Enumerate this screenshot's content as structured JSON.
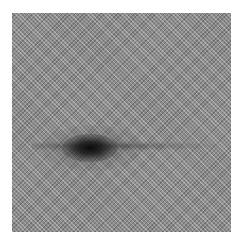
{
  "image": {
    "description": "Grayscale noisy image with fine diagonal checker/stripe texture and a dark elliptical blob left of center, with a faint horizontal dark band through it",
    "background_color": "#8c8c8c",
    "blob_color": "#141414",
    "frame": {
      "left": 12,
      "top": 13,
      "width": 219,
      "height": 219
    },
    "blob_center": {
      "x": 90,
      "y": 147
    }
  }
}
